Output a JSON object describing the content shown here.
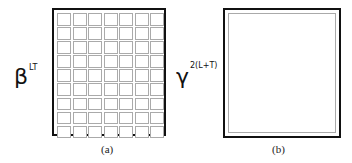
{
  "panel_a": {
    "label_base": "β",
    "label_sup": "LT",
    "grid": {
      "rows": 9,
      "cols": 7
    },
    "caption": "(a)"
  },
  "panel_b": {
    "label_base": "γ",
    "label_sup": "2(L+T)",
    "caption": "(b)"
  }
}
